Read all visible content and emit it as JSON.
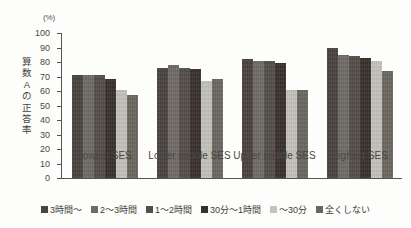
{
  "chart_data": {
    "type": "bar",
    "title": "",
    "subtitle": "",
    "xlabel": "",
    "ylabel": "算数Aの正答率",
    "unit_label": "(%)",
    "ylim": [
      0,
      100
    ],
    "ytick_step": 10,
    "yticks": [
      "100",
      "90",
      "80",
      "70",
      "60",
      "50",
      "40",
      "30",
      "20",
      "10",
      "0"
    ],
    "grid": false,
    "legend_position": "bottom",
    "categories": [
      "Lowest SES",
      "Lower middle SES",
      "Upper middle SES",
      "Highest SES"
    ],
    "series": [
      {
        "name": "3時間～",
        "color": "#4a4340",
        "values": [
          71,
          76,
          82,
          90
        ]
      },
      {
        "name": "2～3時間",
        "color": "#6e6b66",
        "values": [
          71,
          78,
          81,
          85
        ]
      },
      {
        "name": "1～2時間",
        "color": "#544d49",
        "values": [
          71,
          76,
          81,
          84
        ]
      },
      {
        "name": "30分～1時間",
        "color": "#38302c",
        "values": [
          68,
          75,
          79,
          83
        ]
      },
      {
        "name": "～30分",
        "color": "#c3c2bc",
        "values": [
          61,
          67,
          61,
          81
        ]
      },
      {
        "name": "全くしない",
        "color": "#6a6761",
        "values": [
          57,
          68,
          61,
          74
        ]
      }
    ]
  },
  "legend": {
    "items": [
      "3時間～",
      "2～3時間",
      "1～2時間",
      "30分～1時間",
      "～30分",
      "全くしない"
    ]
  },
  "y_axis_title_chars": [
    "算",
    "数",
    "A",
    "の",
    "正",
    "答",
    "率"
  ]
}
